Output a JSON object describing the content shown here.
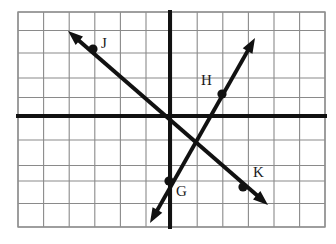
{
  "figure": {
    "type": "coordinate-plane-diagram",
    "title": "",
    "background_color": "#ffffff",
    "plot_area": {
      "left": 18,
      "top": 12,
      "right": 325,
      "bottom": 227
    },
    "grid": {
      "visible": true,
      "cell_size": 25.6,
      "columns": 12,
      "rows": 8.4,
      "line_color": "#8a8a8a",
      "border_color": "#8f8f8f",
      "x_lines": [
        18,
        43.6,
        69.2,
        94.8,
        120.4,
        146,
        171.6,
        197.2,
        222.8,
        248.4,
        274,
        299.6,
        325
      ],
      "y_lines": [
        12,
        30.5,
        53,
        78,
        97.5,
        115,
        140,
        165.5,
        181,
        203.5,
        227
      ]
    },
    "axes": {
      "color": "#111111",
      "stroke_width": 4,
      "x_axis_y": 116,
      "y_axis_x": 170,
      "x_axis_from": 18,
      "x_axis_to": 325,
      "y_axis_from": 12,
      "y_axis_to": 227
    },
    "lines": [
      {
        "name": "line-JK",
        "description": "falling diagonal line through points J and K",
        "color": "#111111",
        "stroke_width": 4,
        "arrow_start": {
          "x": 68,
          "y": 31
        },
        "arrow_end": {
          "x": 268,
          "y": 205
        },
        "points": [
          "J",
          "K"
        ]
      },
      {
        "name": "line-GH",
        "description": "rising diagonal line through points G and H",
        "color": "#111111",
        "stroke_width": 4,
        "arrow_start": {
          "x": 150,
          "y": 223
        },
        "arrow_end": {
          "x": 255,
          "y": 38
        },
        "points": [
          "G",
          "H"
        ]
      }
    ],
    "intersection": {
      "x": 193,
      "y": 140
    },
    "points": [
      {
        "label": "J",
        "x": 93,
        "y": 49,
        "label_x": 101,
        "label_y": 36,
        "dot_radius": 4.6
      },
      {
        "label": "H",
        "x": 222,
        "y": 94,
        "label_x": 201,
        "label_y": 73,
        "dot_radius": 4.6
      },
      {
        "label": "G",
        "x": 169,
        "y": 181,
        "label_x": 176,
        "label_y": 184,
        "dot_radius": 4.6
      },
      {
        "label": "K",
        "x": 243,
        "y": 187,
        "label_x": 253,
        "label_y": 165,
        "dot_radius": 4.6
      }
    ]
  }
}
